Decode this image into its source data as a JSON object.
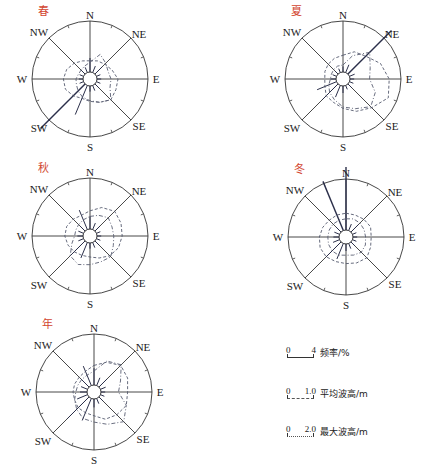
{
  "chart_data": {
    "type": "wind-rose (polar line)",
    "directions": [
      "N",
      "NNE",
      "NE",
      "ENE",
      "E",
      "ESE",
      "SE",
      "SSE",
      "S",
      "SSW",
      "SW",
      "WSW",
      "W",
      "WNW",
      "NW",
      "NNW"
    ],
    "compass_labels": [
      "N",
      "NE",
      "E",
      "SE",
      "S",
      "SW",
      "W",
      "NW"
    ],
    "legend": [
      {
        "label": "频率/%",
        "scale_min": "0",
        "scale_max": "4",
        "style": "solid",
        "unit": "%"
      },
      {
        "label": "平均波高/m",
        "scale_min": "0",
        "scale_max": "1.0",
        "style": "dashed",
        "unit": "m"
      },
      {
        "label": "最大波高/m",
        "scale_min": "0",
        "scale_max": "2.0",
        "style": "dash-dot",
        "unit": "m"
      }
    ],
    "panels": [
      {
        "title": "春",
        "cx": 90,
        "cy": 79,
        "series": [
          {
            "name": "频率/%",
            "values": [
              4.0,
              2.0,
              3.0,
              1.2,
              1.2,
              1.2,
              1.6,
              1.6,
              1.6,
              9.0,
              18.0,
              1.2,
              1.2,
              1.2,
              1.6,
              1.6
            ]
          },
          {
            "name": "平均波高/m",
            "values": [
              0.8,
              0.9,
              1.0,
              1.2,
              1.5,
              1.5,
              1.6,
              1.3,
              1.1,
              1.0,
              1.2,
              1.4,
              1.4,
              1.3,
              1.1,
              0.9
            ]
          },
          {
            "name": "最大波高/m",
            "values": [
              2.8,
              5.6,
              4.4,
              3.6,
              4.0,
              4.2,
              6.4,
              5.2,
              4.2,
              3.6,
              2.8,
              2.2,
              2.0,
              1.6,
              1.6,
              2.0
            ]
          }
        ]
      },
      {
        "title": "夏",
        "cx": 343,
        "cy": 79,
        "series": [
          {
            "name": "频率/%",
            "values": [
              1.6,
              2.4,
              17.6,
              1.6,
              1.2,
              1.2,
              1.6,
              1.2,
              2.0,
              3.6,
              6.4,
              6.0,
              1.6,
              1.2,
              1.2,
              1.2
            ]
          },
          {
            "name": "平均波高/m",
            "values": [
              1.2,
              1.6,
              1.8,
              2.4,
              2.8,
              3.0,
              2.4,
              2.0,
              1.6,
              1.3,
              1.2,
              0.9,
              0.8,
              0.9,
              1.0,
              1.1
            ]
          },
          {
            "name": "最大波高/m",
            "values": [
              2.0,
              5.2,
              8.8,
              6.4,
              5.6,
              8.0,
              9.2,
              7.2,
              6.0,
              4.4,
              3.4,
              2.4,
              1.6,
              1.6,
              1.8,
              2.0
            ]
          }
        ]
      },
      {
        "title": "秋",
        "cx": 90,
        "cy": 236,
        "series": [
          {
            "name": "频率/%",
            "values": [
              3.6,
              2.0,
              2.0,
              1.2,
              1.2,
              1.2,
              1.6,
              1.6,
              1.6,
              4.8,
              6.0,
              1.6,
              1.6,
              1.6,
              2.0,
              6.0
            ]
          },
          {
            "name": "平均波高/m",
            "values": [
              1.3,
              1.7,
              2.0,
              1.9,
              1.8,
              1.7,
              1.5,
              1.2,
              1.0,
              1.0,
              1.1,
              1.2,
              1.3,
              1.3,
              1.2,
              1.1
            ]
          },
          {
            "name": "最大波高/m",
            "values": [
              3.6,
              4.4,
              5.4,
              4.8,
              4.8,
              5.2,
              6.4,
              6.0,
              6.2,
              6.8,
              6.0,
              3.6,
              2.4,
              2.4,
              2.6,
              3.0
            ]
          }
        ]
      },
      {
        "title": "冬",
        "cx": 346,
        "cy": 237,
        "series": [
          {
            "name": "频率/%",
            "values": [
              18.0,
              2.0,
              3.0,
              1.2,
              1.2,
              1.2,
              1.6,
              1.6,
              2.0,
              4.8,
              6.0,
              2.0,
              1.6,
              1.6,
              2.0,
              15.2
            ]
          },
          {
            "name": "平均波高/m",
            "values": [
              1.2,
              1.2,
              1.3,
              1.4,
              1.3,
              1.4,
              1.6,
              1.5,
              1.4,
              1.4,
              1.5,
              1.5,
              1.4,
              1.3,
              1.2,
              1.2
            ]
          },
          {
            "name": "最大波高/m",
            "values": [
              3.2,
              3.6,
              3.6,
              3.6,
              3.6,
              4.0,
              4.2,
              3.6,
              3.2,
              3.6,
              3.6,
              3.4,
              3.2,
              3.2,
              3.2,
              3.2
            ]
          }
        ]
      },
      {
        "title": "年",
        "cx": 94,
        "cy": 392,
        "series": [
          {
            "name": "频率/%",
            "values": [
              4.8,
              2.4,
              3.2,
              1.6,
              1.2,
              1.2,
              1.6,
              1.6,
              2.4,
              6.8,
              8.8,
              3.2,
              2.0,
              2.0,
              3.2,
              6.0
            ]
          },
          {
            "name": "平均波高/m",
            "values": [
              1.4,
              1.8,
              2.2,
              2.1,
              1.9,
              2.0,
              1.8,
              1.6,
              1.2,
              1.1,
              1.1,
              1.0,
              1.0,
              1.0,
              1.0,
              1.1
            ]
          },
          {
            "name": "最大波高/m",
            "values": [
              4.0,
              7.6,
              9.0,
              6.2,
              5.0,
              8.0,
              10.0,
              8.0,
              6.6,
              6.2,
              5.0,
              4.0,
              3.2,
              3.0,
              3.0,
              3.2
            ]
          }
        ]
      }
    ],
    "axis_radius_px": 58,
    "scale_px_per_unit": 14,
    "grid": "compass spokes every 45°, ticks every 22.5°"
  },
  "legend_items": [
    {
      "min": "0",
      "max": "4",
      "label": "频率/%"
    },
    {
      "min": "0",
      "max": "1.0",
      "label": "平均波高/m"
    },
    {
      "min": "0",
      "max": "2.0",
      "label": "最大波高/m"
    }
  ]
}
